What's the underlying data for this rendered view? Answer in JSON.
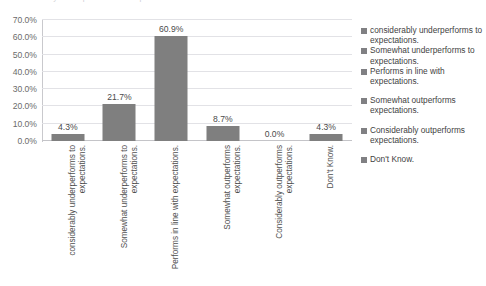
{
  "title_sliver": "considerably underperforms to expectations  Somewhat  Performs in  Somewhat",
  "chart_data": {
    "type": "bar",
    "title": "",
    "subtitle": "",
    "xlabel": "",
    "ylabel": "",
    "ylim": [
      0,
      70
    ],
    "ytick_labels": [
      "70.0%",
      "60.0%",
      "50.0%",
      "40.0%",
      "30.0%",
      "20.0%",
      "10.0%",
      "0.0%"
    ],
    "ytick_values": [
      70,
      60,
      50,
      40,
      30,
      20,
      10,
      0
    ],
    "grid": true,
    "grid_orientation": "horizontal",
    "legend_position": "right",
    "bar_color": "#7f7f7f",
    "gridline_color": "#e2e2e6",
    "categories": [
      "considerably underperforms to expectations.",
      "Somewhat underperforms to expectations.",
      "Performs in line with expectations.",
      "Somewhat outperforms expectations.",
      "Considerably outperforms expectations.",
      "Don't Know."
    ],
    "values": [
      4.3,
      21.7,
      60.9,
      8.7,
      0.0,
      4.3
    ],
    "data_labels": [
      "4.3%",
      "21.7%",
      "60.9%",
      "8.7%",
      "0.0%",
      "4.3%"
    ],
    "legend_entries": [
      "considerably underperforms to expectations.",
      "Somewhat underperforms to expectations.",
      "Performs in line with expectations.",
      "Somewhat outperforms expectations.",
      "Considerably outperforms expectations.",
      "Don't Know."
    ]
  }
}
